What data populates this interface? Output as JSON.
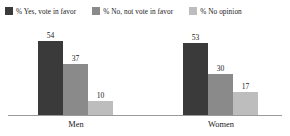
{
  "chart_data": {
    "type": "bar",
    "title": "",
    "subtitle": "",
    "xlabel": "",
    "ylabel": "",
    "ylim": [
      0,
      60
    ],
    "grid": false,
    "legend_position": "top",
    "categories": [
      "Men",
      "Women"
    ],
    "series": [
      {
        "name": "% Yes, vote in favor",
        "color": "#3a3a3a",
        "values": [
          54,
          53
        ]
      },
      {
        "name": "% No, not vote in favor",
        "color": "#8a8a8a",
        "values": [
          37,
          30
        ]
      },
      {
        "name": "% No opinion",
        "color": "#bdbdbd",
        "values": [
          10,
          17
        ]
      }
    ]
  },
  "legend": {
    "items": [
      {
        "label": "% Yes, vote in favor",
        "color": "#3a3a3a",
        "swatch_name": "legend-swatch-yes"
      },
      {
        "label": "% No, not vote in favor",
        "color": "#8a8a8a",
        "swatch_name": "legend-swatch-no"
      },
      {
        "label": "% No opinion",
        "color": "#bdbdbd",
        "swatch_name": "legend-swatch-no-opinion"
      }
    ]
  },
  "axis": {
    "categories": [
      {
        "label": "Men"
      },
      {
        "label": "Women"
      }
    ]
  },
  "bars": {
    "men": [
      {
        "label": "54",
        "series": "% Yes, vote in favor",
        "color": "#3a3a3a"
      },
      {
        "label": "37",
        "series": "% No, not vote in favor",
        "color": "#8a8a8a"
      },
      {
        "label": "10",
        "series": "% No opinion",
        "color": "#bdbdbd"
      }
    ],
    "women": [
      {
        "label": "53",
        "series": "% Yes, vote in favor",
        "color": "#3a3a3a"
      },
      {
        "label": "30",
        "series": "% No, not vote in favor",
        "color": "#8a8a8a"
      },
      {
        "label": "17",
        "series": "% No opinion",
        "color": "#bdbdbd"
      }
    ]
  }
}
